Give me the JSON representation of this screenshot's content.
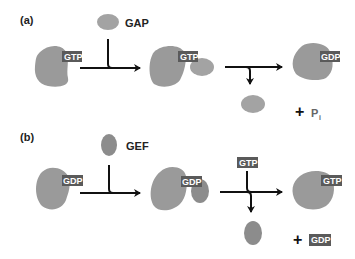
{
  "panels": [
    {
      "label": "(a)",
      "agent": "GAP",
      "start_tag": "GTP",
      "complex_tag": "GTP",
      "end_tag": "GDP",
      "byproduct_plus": "+",
      "byproduct": "P",
      "byproduct_subscript": "i"
    },
    {
      "label": "(b)",
      "agent": "GEF",
      "start_tag": "GDP",
      "complex_tag": "GDP",
      "incoming_tag": "GTP",
      "end_tag": "GTP",
      "byproduct_plus": "+",
      "byproduct_tag": "GDP"
    }
  ],
  "colors": {
    "protein": "#9a9a9a",
    "gap": "#a3a3a3",
    "gef": "#8c8c8c",
    "tag": "#5a5a5a"
  }
}
